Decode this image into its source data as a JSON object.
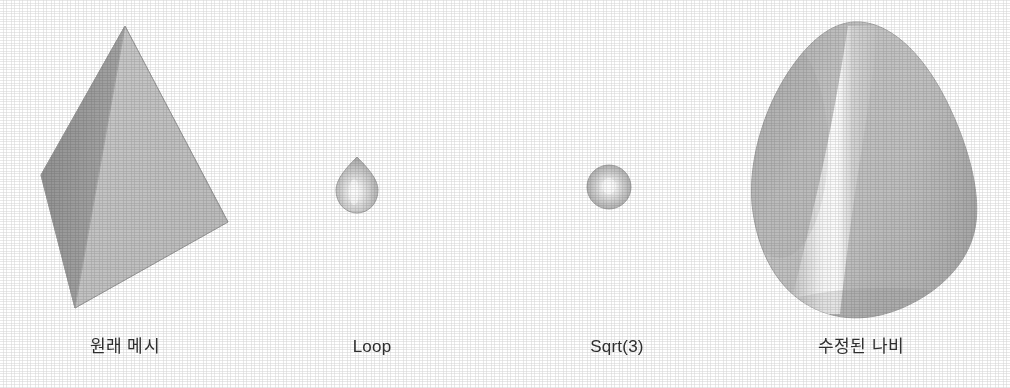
{
  "figure": {
    "background_color": "#ffffff",
    "caption_color": "#2e2e2e"
  },
  "panels": [
    {
      "id": "original",
      "label": "원래 메시",
      "shape": "tetrahedron",
      "description": "Shaded tetrahedron with two visible faces",
      "colors": {
        "face_left_dark": "#9a9a9a",
        "face_front_light": "#c2c2c2",
        "face_right_mid": "#b0b0b0",
        "outline": "#8a8a8a"
      }
    },
    {
      "id": "loop",
      "label": "Loop",
      "shape": "teardrop",
      "description": "Small rounded egg-shaped mesh with specular highlight",
      "colors": {
        "base": "#b4b4b4",
        "highlight": "#fbfbfb",
        "shadow": "#9b9b9b",
        "outline": "#9c9c9c"
      }
    },
    {
      "id": "sqrt3",
      "label": "Sqrt(3)",
      "shape": "sphere",
      "description": "Small round sphere mesh with central specular highlight",
      "colors": {
        "base": "#b6b6b6",
        "highlight": "#fdfdfd",
        "shadow": "#a0a0a0",
        "outline": "#9c9c9c"
      }
    },
    {
      "id": "butterfly",
      "label": "수정된 나비",
      "shape": "rounded-triangular-blob",
      "description": "Large rounded triangular blob with a vertical specular ridge",
      "colors": {
        "base": "#b9b9b9",
        "highlight": "#ffffff",
        "shadow": "#a2a2a2",
        "outline": "#a9a9a9"
      }
    }
  ]
}
